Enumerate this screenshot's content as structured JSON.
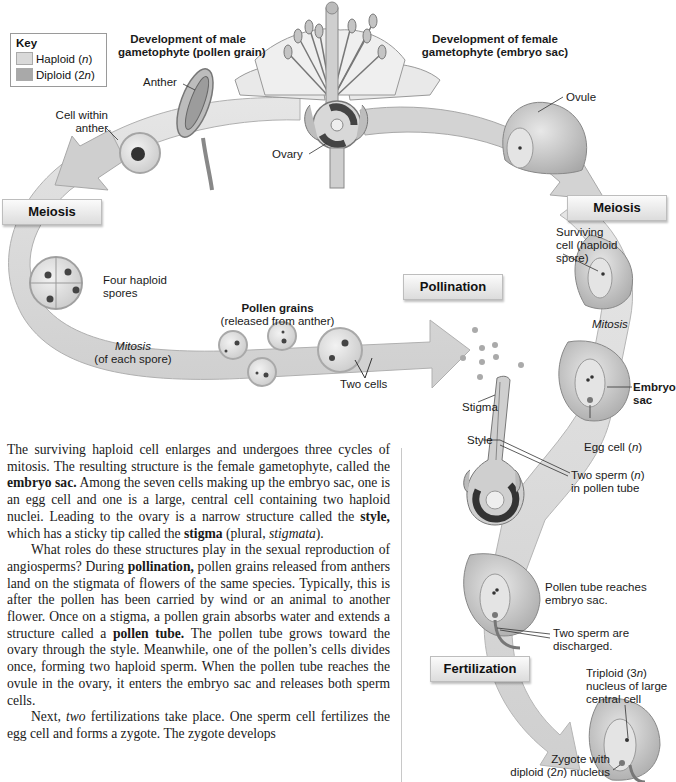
{
  "figure": {
    "key": {
      "title": "Key",
      "items": [
        {
          "label": "Haploid (",
          "italic": "n",
          "suffix": ")",
          "color": "#d9d9d9"
        },
        {
          "label": "Diploid (2",
          "italic": "n",
          "suffix": ")",
          "color": "#a9a9a9"
        }
      ]
    },
    "headings": {
      "male_line1": "Development of male",
      "male_line2": "gametophyte (pollen grain)",
      "female_line1": "Development of female",
      "female_line2": "gametophyte (embryo sac)"
    },
    "stages": {
      "meiosis_left": "Meiosis",
      "meiosis_right": "Meiosis",
      "pollination": "Pollination",
      "fertilization": "Fertilization"
    },
    "labels": {
      "anther": "Anther",
      "cell_within_anther_1": "Cell within",
      "cell_within_anther_2": "anther",
      "ovary": "Ovary",
      "ovule": "Ovule",
      "four_haploid_1": "Four haploid",
      "four_haploid_2": "spores",
      "pollen_grains": "Pollen grains",
      "pollen_grains_sub": "(released from anther)",
      "mitosis_left": "Mitosis",
      "mitosis_left_sub": "(of each spore)",
      "two_cells": "Two cells",
      "surviving_1": "Surviving",
      "surviving_2": "cell (haploid",
      "surviving_3": "spore)",
      "mitosis_right": "Mitosis",
      "embryo_sac_1": "Embryo",
      "embryo_sac_2": "sac",
      "stigma": "Stigma",
      "style": "Style",
      "egg_cell": "Egg cell (",
      "egg_cell_n": "n",
      "egg_cell_end": ")",
      "two_sperm_1": "Two sperm (",
      "two_sperm_n": "n",
      "two_sperm_end": ")",
      "two_sperm_2": "in pollen tube",
      "pollen_tube_reaches_1": "Pollen tube reaches",
      "pollen_tube_reaches_2": "embryo sac.",
      "discharged_1": "Two sperm are",
      "discharged_2": "discharged.",
      "triploid_1a": "Triploid (3",
      "triploid_1n": "n",
      "triploid_1b": ")",
      "triploid_2": "nucleus of large",
      "triploid_3": "central cell",
      "zygote_1": "Zygote with",
      "zygote_2a": "diploid (2",
      "zygote_2n": "n",
      "zygote_2b": ") nucleus"
    }
  },
  "body_text": {
    "p1": {
      "t1": "The surviving haploid cell enlarges and undergoes three cycles of mitosis. The resulting structure is the female gametophyte, called the ",
      "b1": "embryo sac.",
      "t2": " Among the seven cells making up the embryo sac, one is an egg cell and one is a large, central cell containing two haploid nuclei. Leading to the ovary is a narrow structure called the ",
      "b2": "style,",
      "t3": " which has a sticky tip called the ",
      "b3": "stigma",
      "t4": " (plural, ",
      "i1": "stigmata",
      "t5": ")."
    },
    "p2": {
      "t1": "What roles do these structures play in the sexual reproduction of angiosperms? During ",
      "b1": "pollination,",
      "t2": " pollen grains released from anthers land on the stigmata of flowers of the same species. Typically, this is after the pollen has been carried by wind or an animal to another flower. Once on a stigma, a pollen grain absorbs water and extends a structure called a ",
      "b2": "pollen tube.",
      "t3": " The pollen tube grows toward the ovary through the style. Meanwhile, one of the pollen’s cells divides once, forming two haploid sperm. When the pollen tube reaches the ovule in the ovary, it enters the embryo sac and releases both sperm cells."
    },
    "p3": {
      "t1": "Next, ",
      "i1": "two",
      "t2": " fertilizations take place. One sperm cell fertilizes the egg cell and forms a zygote. The zygote develops"
    }
  }
}
